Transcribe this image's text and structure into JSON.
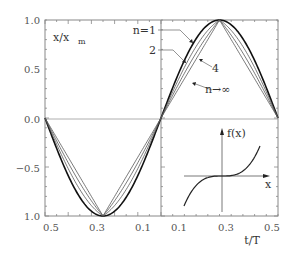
{
  "chart_data": {
    "type": "line",
    "title": "",
    "ylabel": "x/x_m",
    "ylabel_main": "x/x",
    "ylabel_sub": "m",
    "xlabel": "t/T",
    "ylim": [
      -1.0,
      1.0
    ],
    "xlim_left": [
      0.5,
      0.0
    ],
    "xlim_right": [
      0.0,
      0.5
    ],
    "y_ticks": [
      {
        "value": 1.0,
        "label": "1.0"
      },
      {
        "value": 0.5,
        "label": "0.5"
      },
      {
        "value": 0.0,
        "label": "0.0"
      },
      {
        "value": -0.5,
        "label": "−0.5"
      },
      {
        "value": -1.0,
        "label": "1.0"
      }
    ],
    "x_tick_labels": [
      "0.5",
      "0.3",
      "0.1",
      "0.1",
      "0.3",
      "0.5"
    ],
    "grid": false,
    "series": [
      {
        "name": "n=1",
        "label": "n=1",
        "shape": "sine",
        "peak": 1.0,
        "peak_t": 0.25
      },
      {
        "name": "n=2",
        "label": "2",
        "shape": "intermediate",
        "peak": 1.0,
        "peak_t": 0.25
      },
      {
        "name": "n=4",
        "label": "4",
        "shape": "intermediate",
        "peak": 1.0,
        "peak_t": 0.25
      },
      {
        "name": "n→∞",
        "label": "n→∞",
        "shape": "triangle",
        "peak": 1.0,
        "peak_t": 0.25
      }
    ],
    "inset": {
      "title": "f(x)",
      "xlabel": "x",
      "description": "odd cubic-like restoring function, flat near origin"
    }
  }
}
